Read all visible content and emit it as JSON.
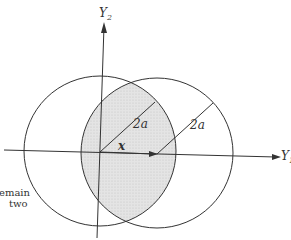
{
  "diagram": {
    "axes": {
      "horizontal_label": "Y",
      "horizontal_subscript": "1",
      "vertical_label": "Y",
      "vertical_subscript": "2"
    },
    "circles": [
      {
        "name": "left-circle",
        "cx": 100,
        "cy": 151,
        "rx": 76,
        "ry": 75
      },
      {
        "name": "right-circle",
        "cx": 157,
        "cy": 153,
        "rx": 76,
        "ry": 75
      }
    ],
    "radius_labels": [
      "2a",
      "2a"
    ],
    "vector_label": "x",
    "overlap_fill": "#dcdcdc",
    "stroke_color": "#333333"
  },
  "caption": {
    "line1": "emain",
    "line2": "two"
  }
}
